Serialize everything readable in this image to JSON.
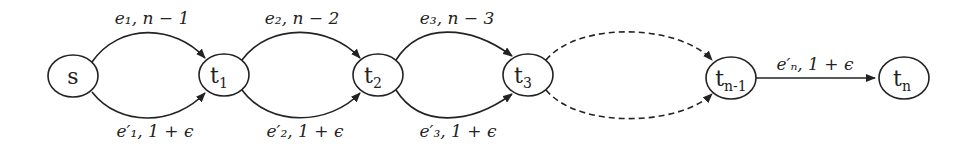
{
  "diagram": {
    "nodes": [
      {
        "id": "s",
        "label": "s",
        "sub": ""
      },
      {
        "id": "t1",
        "label": "t",
        "sub": "1"
      },
      {
        "id": "t2",
        "label": "t",
        "sub": "2"
      },
      {
        "id": "t3",
        "label": "t",
        "sub": "3"
      },
      {
        "id": "tn-1",
        "label": "t",
        "sub": "n-1"
      },
      {
        "id": "tn",
        "label": "t",
        "sub": "n"
      }
    ],
    "edges": [
      {
        "from": "s",
        "to": "t1",
        "label": "e₁, n − 1",
        "style": "solid",
        "position": "upper"
      },
      {
        "from": "s",
        "to": "t1",
        "label": "e′₁, 1 + ϵ",
        "style": "solid",
        "position": "lower"
      },
      {
        "from": "t1",
        "to": "t2",
        "label": "e₂, n − 2",
        "style": "solid",
        "position": "upper"
      },
      {
        "from": "t1",
        "to": "t2",
        "label": "e′₂, 1 + ϵ",
        "style": "solid",
        "position": "lower"
      },
      {
        "from": "t2",
        "to": "t3",
        "label": "e₃, n − 3",
        "style": "solid",
        "position": "upper"
      },
      {
        "from": "t2",
        "to": "t3",
        "label": "e′₃, 1 + ϵ",
        "style": "solid",
        "position": "lower"
      },
      {
        "from": "t3",
        "to": "tn-1",
        "label": "",
        "style": "dashed",
        "position": "upper"
      },
      {
        "from": "t3",
        "to": "tn-1",
        "label": "",
        "style": "dashed",
        "position": "lower"
      },
      {
        "from": "tn-1",
        "to": "tn",
        "label": "e′ₙ, 1 + ϵ",
        "style": "solid",
        "position": "straight"
      }
    ]
  }
}
